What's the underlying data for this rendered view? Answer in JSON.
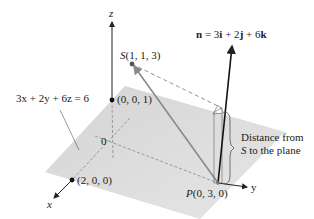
{
  "figure": {
    "plane_equation": "3x + 2y + 6z = 6",
    "normal_vector": {
      "symbol": "n",
      "equals": " = 3",
      "i": "i",
      "plus2": " + 2",
      "j": "j",
      "plus6": " + 6",
      "k": "k"
    },
    "points": {
      "S": {
        "name": "S",
        "coords": "(1, 1, 3)"
      },
      "z_intercept": {
        "coords": "(0, 0, 1)"
      },
      "x_intercept": {
        "coords": "(2, 0, 0)"
      },
      "P": {
        "name": "P",
        "coords": "(0, 3, 0)"
      },
      "origin": {
        "label": "0"
      }
    },
    "axes": {
      "x": "x",
      "y": "y",
      "z": "z"
    },
    "annotation": {
      "line1": "Distance from",
      "line2_var": "S",
      "line2_rest": " to the plane"
    },
    "colors": {
      "plane_fill": "#d9d9d9",
      "axis": "#222222",
      "vector_SP": "#8a8a8a",
      "dashed": "#777777"
    }
  }
}
